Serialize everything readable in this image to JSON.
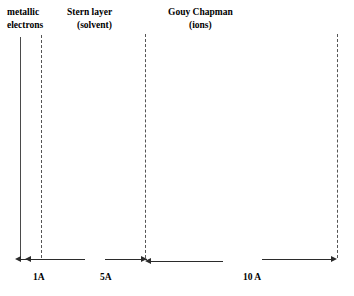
{
  "figure": {
    "background_color": "#ffffff",
    "line_color": "#4a4a4a",
    "arrow_color": "#2b2b2b",
    "text_color": "#000000"
  },
  "regions": [
    {
      "id": "metallic-electrons",
      "line1": "metallic",
      "line2": "electrons",
      "x": 7,
      "y": 6
    },
    {
      "id": "stern-layer",
      "line1": "Stern layer",
      "line2": "(solvent)",
      "x": 67,
      "y": 6
    },
    {
      "id": "gouy-chapman",
      "line1": "Gouy Chapman",
      "line2": "(ions)",
      "x": 168,
      "y": 6
    }
  ],
  "boundaries": [
    {
      "id": "metal-surface",
      "style": "solid",
      "x": 20,
      "top": 37,
      "bottom": 258
    },
    {
      "id": "inner-helmholtz",
      "style": "dashed",
      "x": 41,
      "top": 35,
      "bottom": 258
    },
    {
      "id": "outer-helmholtz",
      "style": "dashed",
      "x": 145,
      "top": 34,
      "bottom": 258
    },
    {
      "id": "diffuse-layer-edge",
      "style": "dashed",
      "x": 337,
      "top": 34,
      "bottom": 258
    }
  ],
  "measures": [
    {
      "id": "measure-1a",
      "label": "1A",
      "label_x": 33,
      "label_y": 272,
      "segments": [
        {
          "x1": 18,
          "x2": 41,
          "y": 259,
          "head_left": true,
          "head_right": false
        },
        {
          "x1": 28,
          "x2": 85,
          "y": 259,
          "head_left": true,
          "head_right": false
        }
      ]
    },
    {
      "id": "measure-5a",
      "label": "5A",
      "label_x": 100,
      "label_y": 272,
      "segments": [
        {
          "x1": 105,
          "x2": 147,
          "y": 259,
          "head_left": false,
          "head_right": true
        }
      ]
    },
    {
      "id": "measure-gouy",
      "label": "",
      "label_x": 0,
      "label_y": 0,
      "segments": [
        {
          "x1": 145,
          "x2": 223,
          "y": 261,
          "head_left": true,
          "head_right": false
        }
      ]
    },
    {
      "id": "measure-10a",
      "label": "10 A",
      "label_x": 243,
      "label_y": 272,
      "segments": [
        {
          "x1": 262,
          "x2": 337,
          "y": 259,
          "head_left": false,
          "head_right": true
        }
      ]
    }
  ]
}
